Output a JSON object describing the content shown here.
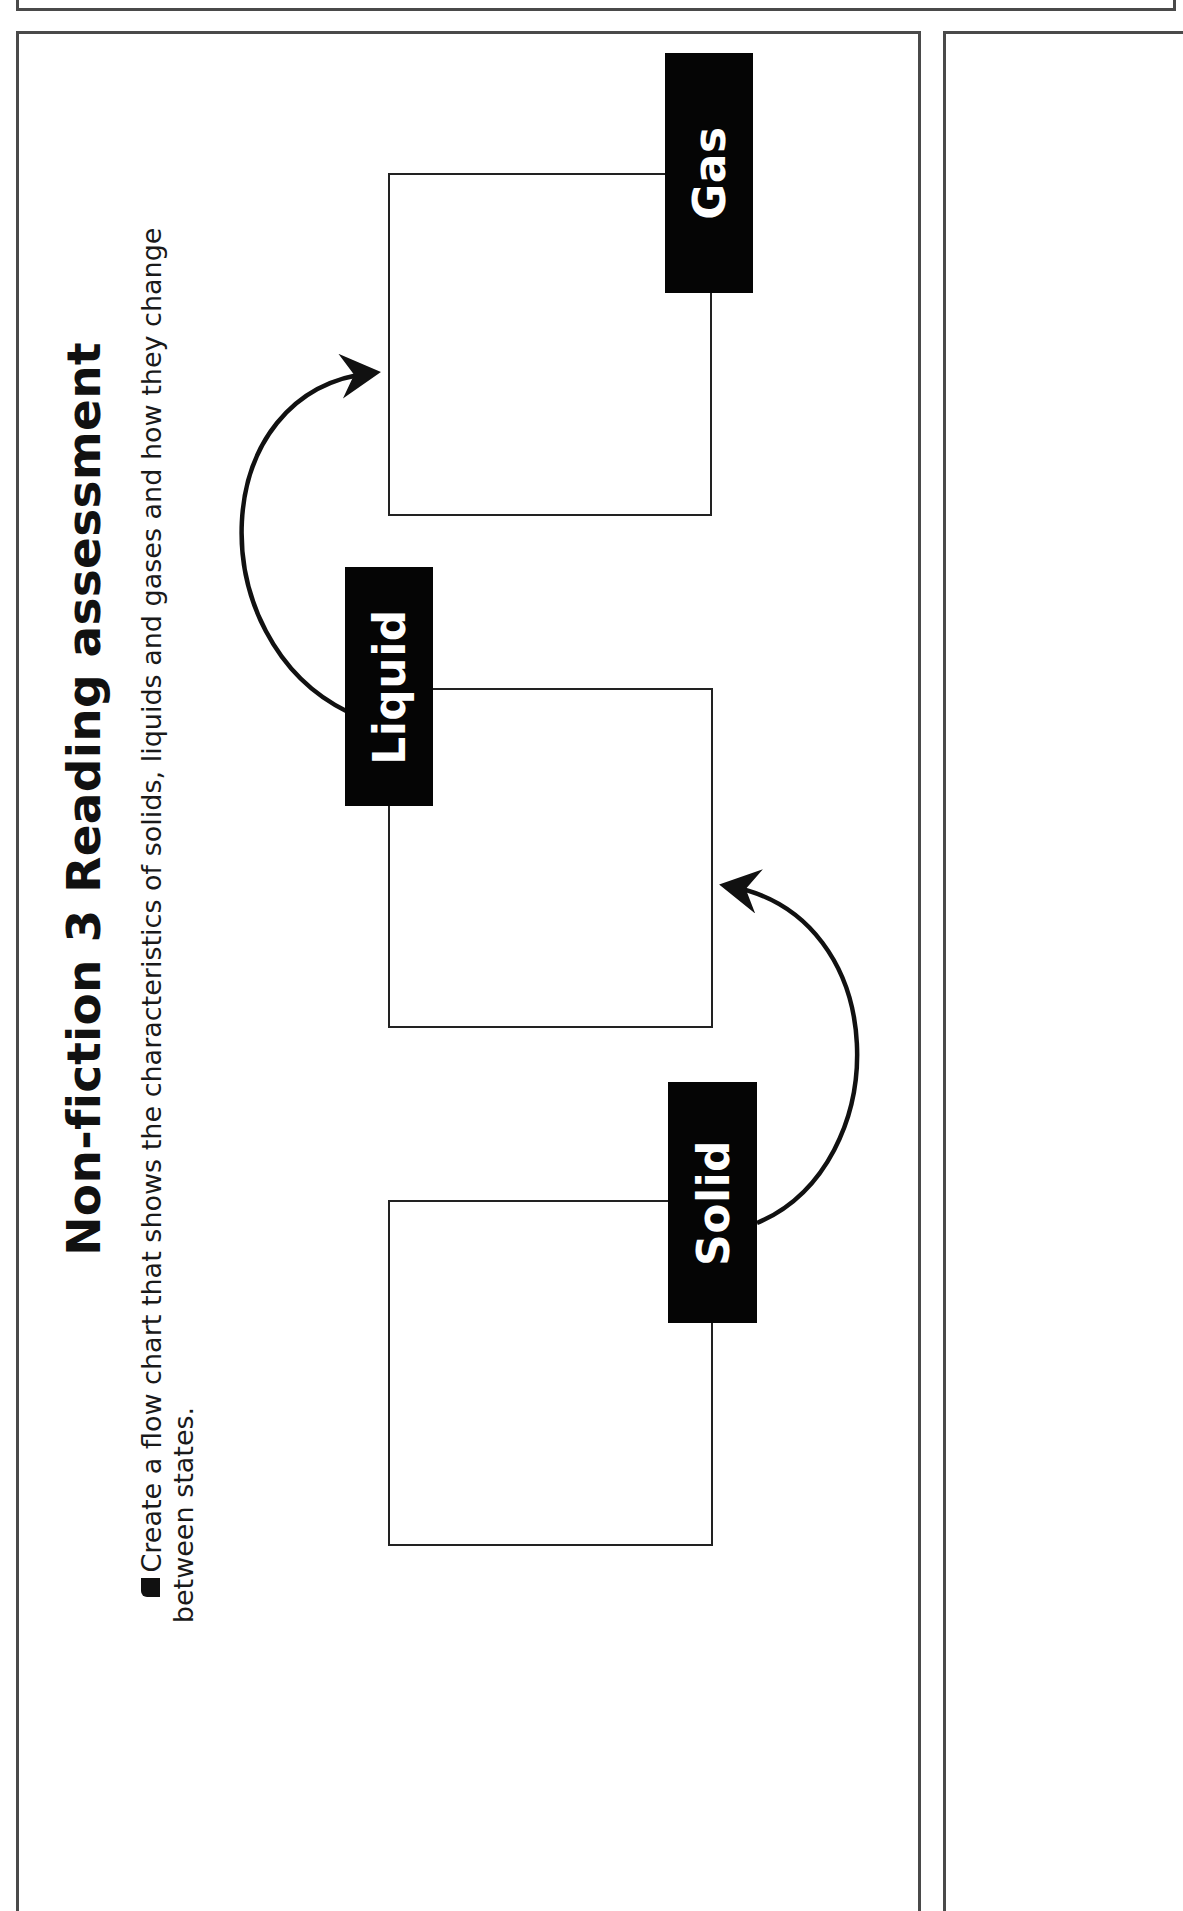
{
  "page": {
    "title": "Non-fiction 3 Reading assessment",
    "instruction": {
      "bullet": "■",
      "line1": "Create a flow chart that shows the characteristics of solids, liquids and gases and how they change",
      "line2": "between states."
    }
  },
  "flowchart": {
    "states": [
      {
        "label": "Solid",
        "content": ""
      },
      {
        "label": "Liquid",
        "content": ""
      },
      {
        "label": "Gas",
        "content": ""
      }
    ],
    "transitions": [
      {
        "from": "Solid",
        "to": "Liquid"
      },
      {
        "from": "Liquid",
        "to": "Gas"
      }
    ]
  },
  "colors": {
    "label_bg": "#050505",
    "label_text": "#ffffff",
    "frame": "#4a4a4a",
    "lines": "#222222"
  }
}
